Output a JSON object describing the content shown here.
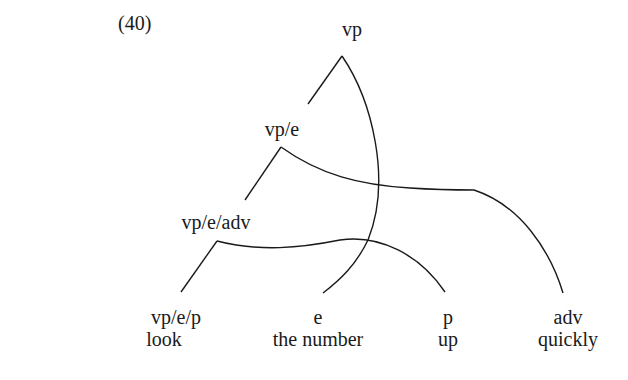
{
  "example_number": "(40)",
  "nodes": {
    "root": "vp",
    "n1": "vp/e",
    "n2": "vp/e/adv"
  },
  "leaves": [
    {
      "category": "vp/e/p",
      "word": "look"
    },
    {
      "category": "e",
      "word": "the number"
    },
    {
      "category": "p",
      "word": "up"
    },
    {
      "category": "adv",
      "word": "quickly"
    }
  ]
}
